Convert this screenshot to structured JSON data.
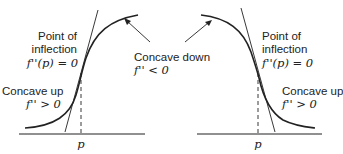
{
  "diagram": {
    "colors": {
      "stroke": "#222222",
      "background": "#ffffff"
    },
    "left_panel": {
      "description": "Increasing curve, concave up then concave down",
      "inflection_label": [
        "Point of",
        "inflection"
      ],
      "inflection_condition": "f''(p) = 0",
      "concave_up_label": "Concave up",
      "concave_up_condition": "f'' > 0",
      "concave_down_label": "Concave down",
      "concave_down_condition": "f'' < 0",
      "axis_tick_label": "p"
    },
    "right_panel": {
      "description": "Decreasing curve, concave down then concave up",
      "inflection_label": [
        "Point of",
        "inflection"
      ],
      "inflection_condition": "f''(p) = 0",
      "concave_up_label": "Concave up",
      "concave_up_condition": "f'' > 0",
      "axis_tick_label": "p"
    }
  }
}
